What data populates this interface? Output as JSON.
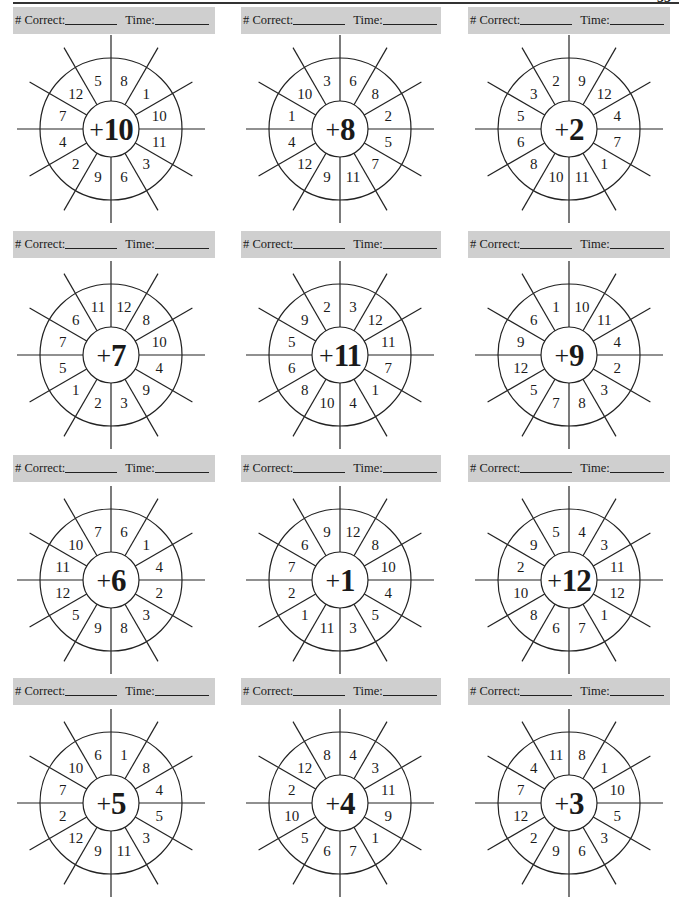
{
  "page_number": "33",
  "header_labels": {
    "correct": "# Correct:",
    "time": "Time:"
  },
  "colors": {
    "header_bar": "#cfcfcf",
    "ink": "#1a1a1a"
  },
  "wheels": [
    {
      "addend": "10",
      "sectors": [
        "8",
        "1",
        "10",
        "11",
        "3",
        "6",
        "9",
        "2",
        "4",
        "7",
        "12",
        "5"
      ]
    },
    {
      "addend": "8",
      "sectors": [
        "6",
        "8",
        "2",
        "5",
        "7",
        "11",
        "9",
        "12",
        "4",
        "1",
        "10",
        "3"
      ]
    },
    {
      "addend": "2",
      "sectors": [
        "9",
        "12",
        "4",
        "7",
        "1",
        "11",
        "10",
        "8",
        "6",
        "5",
        "3",
        "2"
      ]
    },
    {
      "addend": "7",
      "sectors": [
        "12",
        "8",
        "10",
        "4",
        "9",
        "3",
        "2",
        "1",
        "5",
        "7",
        "6",
        "11"
      ]
    },
    {
      "addend": "11",
      "sectors": [
        "3",
        "12",
        "11",
        "7",
        "1",
        "4",
        "10",
        "8",
        "6",
        "5",
        "9",
        "2"
      ]
    },
    {
      "addend": "9",
      "sectors": [
        "10",
        "11",
        "4",
        "2",
        "3",
        "8",
        "7",
        "5",
        "12",
        "9",
        "6",
        "1"
      ]
    },
    {
      "addend": "6",
      "sectors": [
        "6",
        "1",
        "4",
        "2",
        "3",
        "8",
        "9",
        "5",
        "12",
        "11",
        "10",
        "7"
      ]
    },
    {
      "addend": "1",
      "sectors": [
        "12",
        "8",
        "10",
        "4",
        "5",
        "3",
        "11",
        "1",
        "2",
        "7",
        "6",
        "9"
      ]
    },
    {
      "addend": "12",
      "sectors": [
        "4",
        "3",
        "11",
        "12",
        "1",
        "7",
        "6",
        "8",
        "10",
        "2",
        "9",
        "5"
      ]
    },
    {
      "addend": "5",
      "sectors": [
        "1",
        "8",
        "4",
        "5",
        "3",
        "11",
        "9",
        "12",
        "2",
        "7",
        "10",
        "6"
      ]
    },
    {
      "addend": "4",
      "sectors": [
        "4",
        "3",
        "11",
        "9",
        "1",
        "7",
        "6",
        "5",
        "10",
        "2",
        "12",
        "8"
      ]
    },
    {
      "addend": "3",
      "sectors": [
        "8",
        "1",
        "10",
        "5",
        "3",
        "6",
        "9",
        "2",
        "12",
        "7",
        "4",
        "11"
      ]
    }
  ],
  "plus_sign": "+"
}
